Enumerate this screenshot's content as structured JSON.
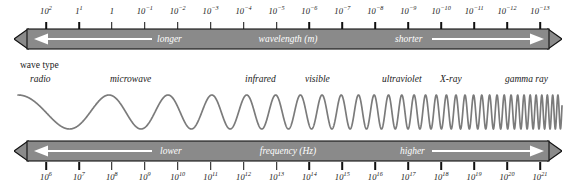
{
  "diagram": {
    "colors": {
      "bar_fill": "#8a8a8a",
      "bar_edge": "#111111",
      "arrow_white": "#ffffff",
      "wave_stroke": "#7b7b7b",
      "tick": "#111111",
      "text": "#1a1a1a",
      "background": "#ffffff"
    }
  },
  "wavelength_axis": {
    "unit_label": "wavelength (m)",
    "left_direction_label": "longer",
    "right_direction_label": "shorter",
    "left_arrow": "arrow-left",
    "right_arrow": "arrow-right",
    "exponents": [
      2,
      1,
      0,
      -1,
      -2,
      -3,
      -4,
      -5,
      -6,
      -7,
      -8,
      -9,
      -10,
      -11,
      -12,
      -13
    ],
    "labels": [
      {
        "base": "10",
        "exp": "2"
      },
      {
        "base": "1",
        "exp": "1"
      },
      {
        "base": "1",
        "exp": ""
      },
      {
        "base": "10",
        "exp": "-1"
      },
      {
        "base": "10",
        "exp": "-2"
      },
      {
        "base": "10",
        "exp": "-3"
      },
      {
        "base": "10",
        "exp": "-4"
      },
      {
        "base": "10",
        "exp": "-5"
      },
      {
        "base": "10",
        "exp": "-6"
      },
      {
        "base": "10",
        "exp": "-7"
      },
      {
        "base": "10",
        "exp": "-8"
      },
      {
        "base": "10",
        "exp": "-9"
      },
      {
        "base": "10",
        "exp": "-10"
      },
      {
        "base": "10",
        "exp": "-11"
      },
      {
        "base": "10",
        "exp": "-12"
      },
      {
        "base": "10",
        "exp": "-13"
      }
    ]
  },
  "frequency_axis": {
    "unit_label": "frequency (Hz)",
    "left_direction_label": "lower",
    "right_direction_label": "higher",
    "left_arrow": "arrow-left",
    "right_arrow": "arrow-right",
    "exponents": [
      6,
      7,
      8,
      9,
      10,
      11,
      12,
      13,
      14,
      15,
      16,
      17,
      18,
      19,
      20,
      21
    ],
    "labels": [
      {
        "base": "10",
        "exp": "6"
      },
      {
        "base": "10",
        "exp": "7"
      },
      {
        "base": "10",
        "exp": "8"
      },
      {
        "base": "10",
        "exp": "9"
      },
      {
        "base": "10",
        "exp": "10"
      },
      {
        "base": "10",
        "exp": "11"
      },
      {
        "base": "10",
        "exp": "12"
      },
      {
        "base": "10",
        "exp": "13"
      },
      {
        "base": "10",
        "exp": "14"
      },
      {
        "base": "10",
        "exp": "15"
      },
      {
        "base": "10",
        "exp": "16"
      },
      {
        "base": "10",
        "exp": "17"
      },
      {
        "base": "10",
        "exp": "18"
      },
      {
        "base": "10",
        "exp": "19"
      },
      {
        "base": "10",
        "exp": "20"
      },
      {
        "base": "10",
        "exp": "21"
      }
    ]
  },
  "wave_type": {
    "header": "wave type",
    "bands": [
      {
        "label": "radio",
        "x": 30
      },
      {
        "label": "microwave",
        "x": 110
      },
      {
        "label": "infrared",
        "x": 245
      },
      {
        "label": "visible",
        "x": 305
      },
      {
        "label": "ultraviolet",
        "x": 382
      },
      {
        "label": "X-ray",
        "x": 440
      },
      {
        "label": "gamma ray",
        "x": 505
      }
    ]
  },
  "wave_curve": {
    "description": "sine wave compressing from long wavelength at left to very short wavelength at right",
    "amplitude": 17,
    "start_period": 120,
    "end_period": 5
  }
}
